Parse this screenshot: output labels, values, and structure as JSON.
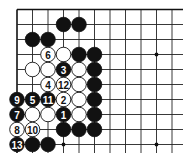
{
  "diagram": {
    "type": "go-board-fragment",
    "grid": {
      "origin_x": 17,
      "origin_y": 9.5,
      "spacing_x": 15.5,
      "spacing_y": 15,
      "columns": 11,
      "rows": 10,
      "line_extend_right": 183,
      "line_extend_bottom": 153,
      "edges": [
        "top",
        "left"
      ]
    },
    "star_points": [
      {
        "col": 9,
        "row": 3
      },
      {
        "col": 3,
        "row": 9
      },
      {
        "col": 9,
        "row": 9
      }
    ],
    "stones": [
      {
        "col": 3,
        "row": 1,
        "color": "black",
        "label": ""
      },
      {
        "col": 4,
        "row": 1,
        "color": "black",
        "label": ""
      },
      {
        "col": 1,
        "row": 2,
        "color": "black",
        "label": ""
      },
      {
        "col": 2,
        "row": 2,
        "color": "black",
        "label": ""
      },
      {
        "col": 2,
        "row": 3,
        "color": "white",
        "label": "6"
      },
      {
        "col": 3,
        "row": 3,
        "color": "white",
        "label": ""
      },
      {
        "col": 4,
        "row": 3,
        "color": "black",
        "label": ""
      },
      {
        "col": 5,
        "row": 3,
        "color": "black",
        "label": ""
      },
      {
        "col": 1,
        "row": 4,
        "color": "white",
        "label": ""
      },
      {
        "col": 2,
        "row": 4,
        "color": "white",
        "label": ""
      },
      {
        "col": 3,
        "row": 4,
        "color": "black",
        "label": "3"
      },
      {
        "col": 4,
        "row": 4,
        "color": "white",
        "label": ""
      },
      {
        "col": 5,
        "row": 4,
        "color": "black",
        "label": ""
      },
      {
        "col": 2,
        "row": 5,
        "color": "white",
        "label": "4"
      },
      {
        "col": 3,
        "row": 5,
        "color": "white",
        "label": "12"
      },
      {
        "col": 4,
        "row": 5,
        "color": "white",
        "label": ""
      },
      {
        "col": 5,
        "row": 5,
        "color": "black",
        "label": ""
      },
      {
        "col": 0,
        "row": 6,
        "color": "black",
        "label": "9"
      },
      {
        "col": 1,
        "row": 6,
        "color": "black",
        "label": "5"
      },
      {
        "col": 2,
        "row": 6,
        "color": "black",
        "label": "11"
      },
      {
        "col": 3,
        "row": 6,
        "color": "white",
        "label": "2"
      },
      {
        "col": 4,
        "row": 6,
        "color": "white",
        "label": ""
      },
      {
        "col": 5,
        "row": 6,
        "color": "black",
        "label": ""
      },
      {
        "col": 0,
        "row": 7,
        "color": "black",
        "label": "7"
      },
      {
        "col": 1,
        "row": 7,
        "color": "white",
        "label": ""
      },
      {
        "col": 2,
        "row": 7,
        "color": "white",
        "label": ""
      },
      {
        "col": 3,
        "row": 7,
        "color": "black",
        "label": "1"
      },
      {
        "col": 4,
        "row": 7,
        "color": "white",
        "label": ""
      },
      {
        "col": 5,
        "row": 7,
        "color": "black",
        "label": ""
      },
      {
        "col": 0,
        "row": 8,
        "color": "white",
        "label": "8"
      },
      {
        "col": 1,
        "row": 8,
        "color": "white",
        "label": "10"
      },
      {
        "col": 3,
        "row": 8,
        "color": "black",
        "label": ""
      },
      {
        "col": 4,
        "row": 8,
        "color": "black",
        "label": ""
      },
      {
        "col": 5,
        "row": 8,
        "color": "black",
        "label": ""
      },
      {
        "col": 0,
        "row": 9,
        "color": "black",
        "label": "13"
      },
      {
        "col": 1,
        "row": 9,
        "color": "black",
        "label": ""
      },
      {
        "col": 2,
        "row": 9,
        "color": "black",
        "label": ""
      }
    ],
    "colors": {
      "board": "#ffffff",
      "line": "#222222",
      "black_stone": "#111111",
      "white_stone": "#ffffff"
    }
  }
}
